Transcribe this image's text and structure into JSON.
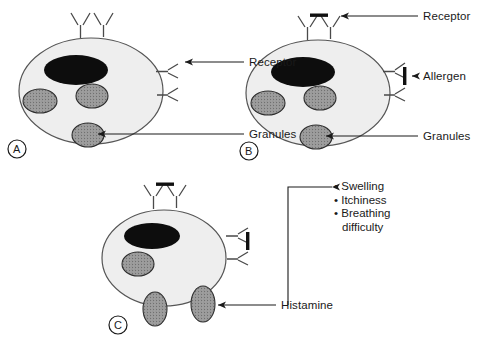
{
  "figure": {
    "background_color": "#ffffff",
    "line_color": "#3a3a3a",
    "cell_fill": "#eeeeee",
    "nucleus_color": "#0d0d0d",
    "granule_fill": "#9a9a9a",
    "text_color": "#1a1a1a"
  },
  "panels": [
    {
      "id": "A",
      "label": "A",
      "description": "Resting mast cell with surface receptors and internal granules",
      "callouts": [
        {
          "name": "receptor",
          "text": "Receptor"
        },
        {
          "name": "granules",
          "text": "Granules"
        }
      ],
      "counts": {
        "top_receptors": 2,
        "side_receptors": 2,
        "granules": 3,
        "nucleus": 1
      }
    },
    {
      "id": "B",
      "label": "B",
      "description": "Allergen cross-links the receptors on the mast cell surface",
      "callouts": [
        {
          "name": "receptor",
          "text": "Receptor"
        },
        {
          "name": "allergen",
          "text": "Allergen"
        },
        {
          "name": "granules",
          "text": "Granules"
        }
      ],
      "counts": {
        "top_receptors": 2,
        "side_receptors": 2,
        "granules": 3,
        "nucleus": 1,
        "allergens": 2
      }
    },
    {
      "id": "C",
      "label": "C",
      "description": "Degranulation: granules release histamine outside the cell",
      "callouts": [
        {
          "name": "histamine",
          "text": "Histamine"
        }
      ],
      "counts": {
        "top_receptors": 2,
        "side_receptors": 2,
        "granules": 1,
        "nucleus": 1,
        "allergens": 2,
        "released_granules": 2
      }
    }
  ],
  "symptoms": {
    "name": "histamine-effects",
    "items": [
      {
        "text": "Swelling"
      },
      {
        "text": "Itchiness"
      },
      {
        "text": "Breathing"
      },
      {
        "text": "difficulty",
        "indent": true
      }
    ]
  }
}
